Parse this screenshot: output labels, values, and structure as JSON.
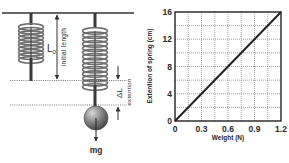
{
  "diagram": {
    "labels": {
      "initial_length_symbol": "L",
      "initial_length_subscript": "0",
      "initial_length_text": "initial length",
      "extension_symbol": "ΔL",
      "extension_text": "extention",
      "force_label": "mg"
    },
    "colors": {
      "spring": "#6f6f6f",
      "rod": "#3a3a3a",
      "ball": "#7a7a7a",
      "line": "#333333"
    }
  },
  "chart_data": {
    "type": "line",
    "title": "",
    "xlabel": "Weight (N)",
    "ylabel": "Extention of spring (cm)",
    "xlim": [
      0,
      1.2
    ],
    "ylim": [
      0,
      16
    ],
    "x_ticks": [
      0,
      0.3,
      0.6,
      0.9,
      1.2
    ],
    "x_tick_labels": [
      "0",
      "0.3",
      "0.6",
      "0.9",
      "1.2"
    ],
    "y_ticks": [
      0,
      4,
      8,
      12,
      16
    ],
    "y_tick_labels": [
      "0",
      "4",
      "8",
      "12",
      "16"
    ],
    "x_grid_step": 0.15,
    "y_grid_step": 2,
    "grid": true,
    "legend": "none",
    "series": [
      {
        "name": "extension",
        "x": [
          0,
          1.2
        ],
        "y": [
          0,
          16
        ]
      }
    ]
  }
}
